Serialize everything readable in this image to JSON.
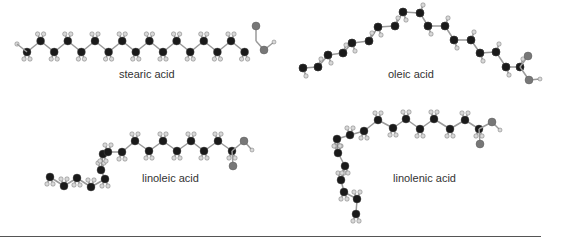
{
  "molecules": [
    {
      "name": "stearic acid",
      "label_pos": [
        119,
        76
      ]
    },
    {
      "name": "oleic acid",
      "label_pos": [
        388,
        71
      ]
    },
    {
      "name": "linoleic acid",
      "label_pos": [
        142,
        172
      ]
    },
    {
      "name": "linolenic acid",
      "label_pos": [
        393,
        173
      ]
    }
  ],
  "colors": {
    "carbon": "#1a1a1a",
    "hydrogen": "#d8d8d8",
    "oxygen": "#777777",
    "bond": "#9a9a9a",
    "rule": "#555555"
  }
}
